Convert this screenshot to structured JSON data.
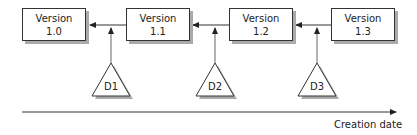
{
  "versions": [
    {
      "line1": "Version",
      "line2": "1.0"
    },
    {
      "line1": "Version",
      "line2": "1.1"
    },
    {
      "line1": "Version",
      "line2": "1.2"
    },
    {
      "line1": "Version",
      "line2": "1.3"
    }
  ],
  "deltas": [
    {
      "label": "D1"
    },
    {
      "label": "D2"
    },
    {
      "label": "D3"
    }
  ],
  "axis": {
    "label": "Creation date"
  }
}
